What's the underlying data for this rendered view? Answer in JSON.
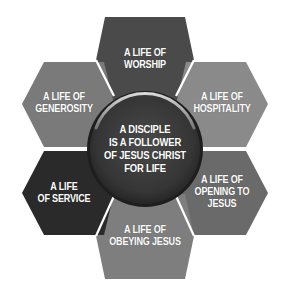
{
  "diagram": {
    "center": {
      "lines": [
        "A DISCIPLE",
        "IS A FOLLOWER",
        "OF JESUS CHRIST",
        "FOR LIFE"
      ],
      "color": "#3c3c3c",
      "ring_highlight": "#cfcfcf"
    },
    "hexagons": [
      {
        "id": "worship",
        "lines": [
          "A LIFE OF",
          "WORSHIP"
        ],
        "color": "#4a4a4a"
      },
      {
        "id": "hospitality",
        "lines": [
          "A LIFE OF",
          "HOSPITALITY"
        ],
        "color": "#8a8a8a"
      },
      {
        "id": "opening",
        "lines": [
          "A LIFE OF",
          "OPENING TO",
          "JESUS"
        ],
        "color": "#6a6a6a"
      },
      {
        "id": "obeying",
        "lines": [
          "A LIFE OF",
          "OBEYING JESUS"
        ],
        "color": "#7e7e7e"
      },
      {
        "id": "service",
        "lines": [
          "A LIFE",
          "OF SERVICE"
        ],
        "color": "#2a2a2a"
      },
      {
        "id": "generosity",
        "lines": [
          "A LIFE OF",
          "GENEROSITY"
        ],
        "color": "#7a7a7a"
      }
    ],
    "separator_color": "#ffffff",
    "background": "#ffffff"
  }
}
